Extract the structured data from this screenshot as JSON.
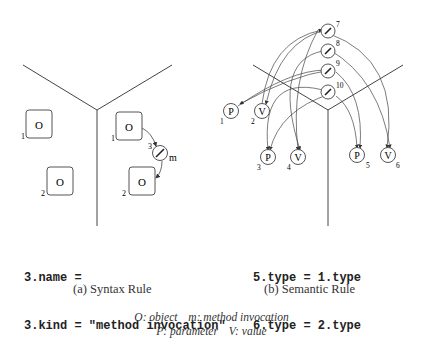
{
  "panel_a": {
    "nodes": [
      {
        "id": "1",
        "label": "O",
        "type": "object"
      },
      {
        "id": "2",
        "label": "O",
        "type": "object"
      },
      {
        "id": "1",
        "label": "O",
        "type": "object"
      },
      {
        "id": "2",
        "label": "O",
        "type": "object"
      },
      {
        "id": "3",
        "label": "m",
        "type": "method invocation"
      }
    ],
    "code": [
      "3.name =",
      "3.kind = \"method invocation\""
    ],
    "caption": "(a) Syntax Rule"
  },
  "panel_b": {
    "nodes": [
      {
        "id": "1",
        "label": "P"
      },
      {
        "id": "2",
        "label": "V"
      },
      {
        "id": "3",
        "label": "P"
      },
      {
        "id": "4",
        "label": "V"
      },
      {
        "id": "5",
        "label": "P"
      },
      {
        "id": "6",
        "label": "V"
      },
      {
        "id": "7",
        "label": ""
      },
      {
        "id": "8",
        "label": ""
      },
      {
        "id": "9",
        "label": ""
      },
      {
        "id": "10",
        "label": ""
      }
    ],
    "code": [
      "5.type = 1.type",
      "6.type = 2.type"
    ],
    "caption": "(b) Semantic Rule"
  },
  "legend": {
    "line1": [
      "O: object",
      "m: method invocation"
    ],
    "line2": [
      "P: parameter",
      "V: value"
    ]
  }
}
